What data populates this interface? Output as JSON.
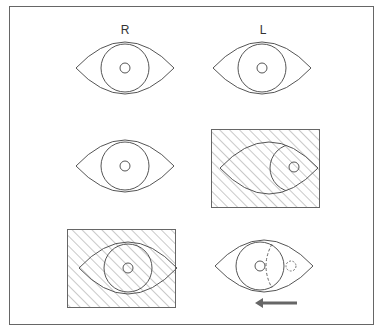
{
  "figure": {
    "column_labels": [
      "R",
      "L"
    ],
    "stroke_color": "#555555",
    "hatch_color": "#777777",
    "arrow_color": "#666666",
    "rows": [
      {
        "row": 1,
        "right_eye": {
          "state": "normal",
          "occluded": false
        },
        "left_eye": {
          "state": "normal",
          "occluded": false
        }
      },
      {
        "row": 2,
        "right_eye": {
          "state": "normal",
          "occluded": false
        },
        "left_eye": {
          "state": "deviated-out (covered)",
          "occluded": true
        }
      },
      {
        "row": 3,
        "right_eye": {
          "state": "normal (covered)",
          "occluded": true
        },
        "left_eye": {
          "state": "refixation movement inward",
          "occluded": false,
          "dashed_prior_position": true,
          "arrow": "left"
        }
      }
    ]
  }
}
